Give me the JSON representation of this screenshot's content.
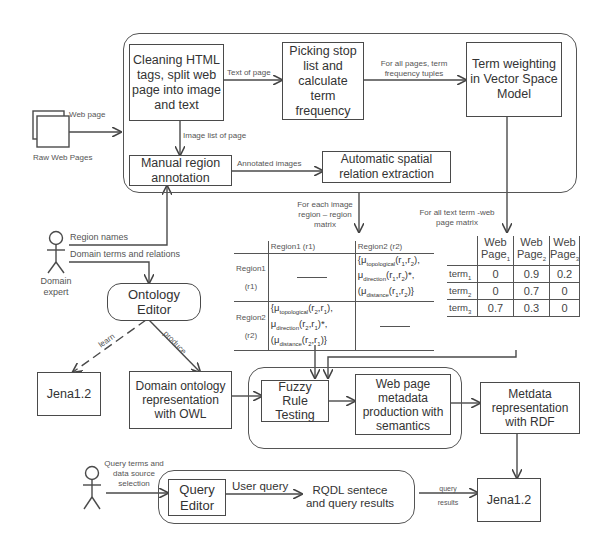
{
  "diagram": {
    "top_group": {
      "boxes": {
        "cleaning": "Cleaning HTML tags, split web page into image and text",
        "picking": "Picking stop list and calculate term frequency",
        "term_weighting": "Term weighting in Vector Space Model",
        "manual_region": "Manual region annotation",
        "automatic_spatial": "Automatic spatial relation extraction"
      },
      "edges": {
        "text_of_page": "Text of page",
        "term_frequency_tuples": "For all pages, term frequency tuples",
        "image_list": "Image list of page",
        "annotated_images": "Annotated images"
      }
    },
    "raw_web_pages": {
      "label": "Raw Web Pages",
      "edge": "Web page"
    },
    "domain_expert": {
      "label_line1": "Domain",
      "label_line2": "expert",
      "edge_region_names": "Region names",
      "edge_domain_terms": "Domain terms and relations"
    },
    "ontology_editor": "Ontology Editor",
    "ontology_edges": {
      "learn": "learn",
      "produce": "produce"
    },
    "jena_left": "Jena1.2",
    "domain_ontology": "Domain ontology representation with OWL",
    "region_matrix": {
      "edge_label_line1": "For each image",
      "edge_label_line2": "region – region matrix",
      "col_headers": [
        "Region1 (r1)",
        "Region2 (r2)"
      ],
      "rows": [
        {
          "header_line1": "Region1",
          "header_line2": "(r1)"
        },
        {
          "header_line1": "Region2",
          "header_line2": "(r2)"
        }
      ]
    },
    "term_matrix": {
      "edge_label_line1": "For all text term -web",
      "edge_label_line2": "page matrix",
      "col_headers": [
        {
          "line1": "Web",
          "line2": "Page",
          "sub": "1"
        },
        {
          "line1": "Web",
          "line2": "Page",
          "sub": "2"
        },
        {
          "line1": "Web",
          "line2": "Page",
          "sub": "3"
        }
      ],
      "rows": [
        {
          "term": "term",
          "sub": "1",
          "values": [
            "0",
            "0.9",
            "0.2"
          ]
        },
        {
          "term": "term",
          "sub": "2",
          "values": [
            "0",
            "0.7",
            "0"
          ]
        },
        {
          "term": "term",
          "sub": "3",
          "values": [
            "0.7",
            "0.3",
            "0"
          ]
        }
      ]
    },
    "middle_group": {
      "fuzzy": "Fuzzy Rule Testing",
      "metadata_production": "Web page metadata production with semantics"
    },
    "metadata_rdf": "Metdata representation with RDF",
    "query_user": {
      "edge_line1": "Query terms and",
      "edge_line2": "data source",
      "edge_line3": "selection"
    },
    "bottom_group": {
      "query_editor": "Query Editor",
      "user_query": "User query",
      "rqdl_line1": "RQDL sentece",
      "rqdl_line2": "and query results"
    },
    "query_results_edge_line1": "query",
    "query_results_edge_line2": "results",
    "jena_right": "Jena1.2"
  }
}
